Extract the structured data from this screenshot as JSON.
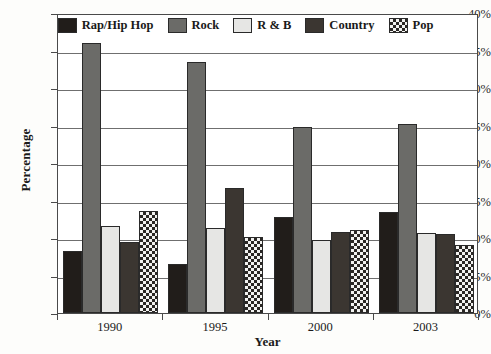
{
  "chart_data": {
    "type": "bar",
    "title": "",
    "xlabel": "Year",
    "ylabel": "Percentage",
    "categories": [
      "1990",
      "1995",
      "2000",
      "2003"
    ],
    "ylim": [
      0,
      40
    ],
    "ytick_labels": [
      "0%",
      "5%",
      "10%",
      "15%",
      "20%",
      "25%",
      "30%",
      "35%",
      "40%"
    ],
    "ytick_values": [
      0,
      5,
      10,
      15,
      20,
      25,
      30,
      35,
      40
    ],
    "grid": true,
    "legend_position": "top-center",
    "series": [
      {
        "name": "Rap/Hip Hop",
        "color": "#211d1a",
        "pattern": "solid",
        "values": [
          8.3,
          6.6,
          12.8,
          13.5
        ]
      },
      {
        "name": "Rock",
        "color": "#6b6b68",
        "pattern": "solid",
        "values": [
          36.0,
          33.5,
          24.8,
          25.2
        ]
      },
      {
        "name": "R & B",
        "color": "#e6e6e4",
        "pattern": "solid",
        "values": [
          11.6,
          11.3,
          9.7,
          10.7
        ]
      },
      {
        "name": "Country",
        "color": "#3b3631",
        "pattern": "solid",
        "values": [
          9.5,
          16.7,
          10.8,
          10.6
        ]
      },
      {
        "name": "Pop",
        "color": "#f2f2f0",
        "pattern": "checkered",
        "values": [
          13.6,
          10.1,
          11.1,
          9.1
        ]
      }
    ]
  }
}
